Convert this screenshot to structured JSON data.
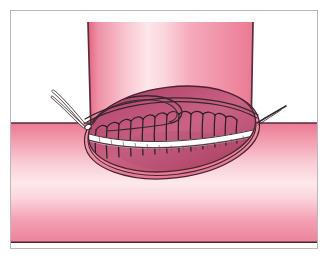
{
  "figure": {
    "type": "medical-surgical-illustration",
    "frame": {
      "border_color": "#b9b9b9",
      "background_color": "#ffffff",
      "x": 10,
      "y": 10,
      "width": 308,
      "height": 239
    },
    "canvas": {
      "width": 330,
      "height": 261
    }
  },
  "palette": {
    "outline_dark": "#4a2430",
    "outline_thread": "#33262c",
    "tube_pink_dark": "#e8738f",
    "tube_pink_mid": "#f093a9",
    "tube_pink_light": "#fbd7de",
    "tube_pink_pale": "#fae3e8",
    "lumen_magenta_dark": "#b4456b",
    "lumen_magenta_mid": "#c3587b",
    "lumen_magenta_light": "#cf6b8b",
    "suture_white": "#ffffff",
    "suture_shadow": "#d9c9cf",
    "needle_white": "#fdfdfd",
    "background": "#ffffff"
  },
  "parts": {
    "vertical_limb": {
      "label": "vertical bowel limb",
      "description": "Proximal bowel segment descending from top of frame",
      "fill_description": "vertical pink gradient, light highlight band left of center",
      "top_y": 21,
      "left_x": 85,
      "right_x": 251
    },
    "horizontal_limb": {
      "label": "horizontal bowel limb",
      "description": "Recipient bowel running left-to-right across lower frame",
      "fill_description": "horizontal pink gradient, pale highlight mid-height",
      "top_y": 122,
      "bottom_y": 240
    },
    "stoma_ellipse": {
      "label": "anastomotic stoma",
      "description": "Oval opening showing mucosal lumen, double-line rim",
      "center_x": 161,
      "center_y": 128,
      "radius_x": 84,
      "radius_y": 42,
      "rotation_deg": -7
    },
    "suture_line": {
      "label": "continuous running suture",
      "description": "White highlighted suture band crossing stoma with regular stitch loops",
      "stitch_count": 13,
      "color": "#ffffff"
    },
    "needle": {
      "label": "curved surgical needle",
      "description": "Curved needle with swaged suture entering tissue at left apex",
      "tip_x": 77,
      "tip_y": 116
    },
    "suture_tails": {
      "label": "suture tails",
      "description": "Two free thread ends exiting left apex, one tail exiting right apex",
      "left_count": 2,
      "right_count": 1
    },
    "suture_loop": {
      "label": "suture loop",
      "description": "Slack loop of thread arcing over upper surface of stoma"
    }
  }
}
